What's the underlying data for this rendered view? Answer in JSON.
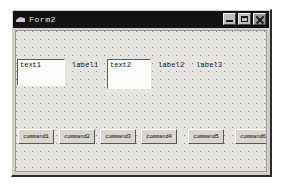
{
  "window": {
    "title": "Form2",
    "icon": "vb-form-icon",
    "controls": [
      {
        "name": "minimize",
        "glyph": "minimize-icon"
      },
      {
        "name": "maximize",
        "glyph": "maximize-icon"
      },
      {
        "name": "close",
        "glyph": "close-icon"
      }
    ]
  },
  "form": {
    "textboxes": [
      {
        "name": "text1",
        "value": "text1"
      },
      {
        "name": "text2",
        "value": "text2"
      }
    ],
    "labels": [
      {
        "name": "label1",
        "caption": "label1"
      },
      {
        "name": "label2",
        "caption": "label2"
      },
      {
        "name": "label3",
        "caption": "label3"
      }
    ],
    "buttons": [
      {
        "name": "command1",
        "caption": "command1"
      },
      {
        "name": "command2",
        "caption": "command2"
      },
      {
        "name": "command3",
        "caption": "command3"
      },
      {
        "name": "command4",
        "caption": "command4"
      },
      {
        "name": "command5",
        "caption": "command5"
      },
      {
        "name": "command6",
        "caption": "command6"
      }
    ]
  },
  "colors": {
    "titlebar": "#121212",
    "title_text": "#e8e8e8",
    "form_face": "#d4d0c8",
    "form_client": "#e6e4e0",
    "grid_dot": "#8d8d8d",
    "textbox_face": "#fbfbf9",
    "button_face": "#d9d6d0"
  }
}
